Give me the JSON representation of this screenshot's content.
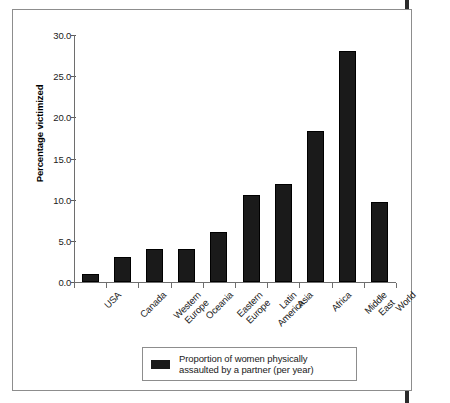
{
  "figure": {
    "frame_color": "#8d8d8d",
    "background": "#ffffff",
    "bar_color": "#1a1a1a"
  },
  "legend": {
    "line1": "Proportion of women physically",
    "line2": "assaulted by a partner (per year)",
    "swatch_name": "legend-color-swatch"
  },
  "chart_data": {
    "type": "bar",
    "title": "",
    "xlabel": "",
    "ylabel": "Percentage victimized",
    "ylim": [
      0.0,
      30.0
    ],
    "ytick_labels": [
      "0.0",
      "5.0",
      "10.0",
      "15.0",
      "20.0",
      "25.0",
      "30.0"
    ],
    "ytick_values": [
      0.0,
      5.0,
      10.0,
      15.0,
      20.0,
      25.0,
      30.0
    ],
    "grid": false,
    "legend_position": "bottom-center",
    "categories": [
      "USA",
      "Canada",
      "Western Europe",
      "Oceania",
      "Eastern Europe",
      "Latin America",
      "Asia",
      "Africa",
      "Middle East",
      "World"
    ],
    "category_lines": [
      [
        "USA",
        ""
      ],
      [
        "Canada",
        ""
      ],
      [
        "Western",
        "Europe"
      ],
      [
        "Oceania",
        ""
      ],
      [
        "Eastern",
        "Europe"
      ],
      [
        "Latin",
        "America"
      ],
      [
        "Asia",
        ""
      ],
      [
        "Africa",
        ""
      ],
      [
        "Middle",
        "East"
      ],
      [
        "World",
        ""
      ]
    ],
    "series": [
      {
        "name": "Proportion of women physically assaulted by a partner (per year)",
        "values": [
          1.0,
          3.0,
          4.0,
          4.0,
          6.1,
          10.6,
          11.9,
          18.4,
          28.0,
          9.7
        ]
      }
    ]
  }
}
